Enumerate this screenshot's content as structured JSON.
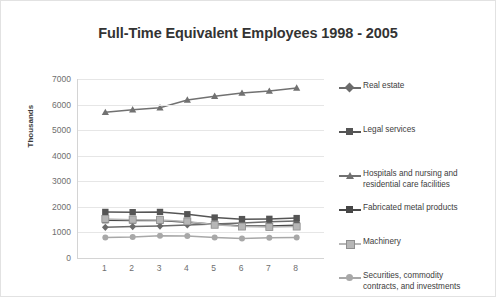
{
  "chart_data": {
    "type": "line",
    "title": "Full-Time Equivalent Employees 1998 - 2005",
    "xlabel": "",
    "ylabel": "Thousands",
    "ylim": [
      0,
      7000
    ],
    "ytick_labels": [
      "7000",
      "6000",
      "5000",
      "4000",
      "3000",
      "2000",
      "1000",
      "0"
    ],
    "yticks": [
      7000,
      6000,
      5000,
      4000,
      3000,
      2000,
      1000,
      0
    ],
    "grid": true,
    "legend_position": "right",
    "categories": [
      "1",
      "2",
      "3",
      "4",
      "5",
      "6",
      "7",
      "8"
    ],
    "x": [
      1,
      2,
      3,
      4,
      5,
      6,
      7,
      8
    ],
    "series": [
      {
        "name": "Real estate",
        "marker": "diamond",
        "color": "#6b6b6b",
        "values": [
          1200,
          1230,
          1250,
          1290,
          1330,
          1370,
          1420,
          1450
        ]
      },
      {
        "name": "Legal services",
        "marker": "square",
        "color": "#555555",
        "values": [
          1800,
          1790,
          1800,
          1710,
          1580,
          1520,
          1530,
          1560
        ]
      },
      {
        "name": "Hospitals and nursing and\nresidential care facilities",
        "marker": "triangle",
        "color": "#717171",
        "values": [
          5700,
          5800,
          5880,
          6180,
          6330,
          6450,
          6530,
          6650
        ]
      },
      {
        "name": "Fabricated metal products",
        "marker": "square",
        "color": "#474747",
        "values": [
          1480,
          1470,
          1470,
          1400,
          1320,
          1250,
          1250,
          1280
        ]
      },
      {
        "name": "Machinery",
        "marker": "square-light",
        "color": "#b6b6b6",
        "values": [
          1530,
          1500,
          1490,
          1430,
          1300,
          1230,
          1210,
          1230
        ]
      },
      {
        "name": "Securities, commodity\ncontracts, and investments",
        "marker": "circle",
        "color": "#a8a8a8",
        "values": [
          800,
          820,
          870,
          860,
          800,
          760,
          790,
          800
        ]
      }
    ]
  },
  "legend": {
    "entries": [
      {
        "label": "Real estate",
        "top": 8
      },
      {
        "label": "Legal services",
        "top": 52
      },
      {
        "label": "Hospitals and nursing and\nresidential care facilities",
        "top": 96
      },
      {
        "label": "Fabricated metal products",
        "top": 130
      },
      {
        "label": "Machinery",
        "top": 164
      },
      {
        "label": "Securities, commodity\ncontracts, and investments",
        "top": 198
      }
    ]
  },
  "colors": {
    "frame_border": "#e2e2e2",
    "gridline": "#e6e6e6",
    "axis": "#d4d4d4",
    "tick_text": "#6e6e6e",
    "title_text": "#333333"
  }
}
